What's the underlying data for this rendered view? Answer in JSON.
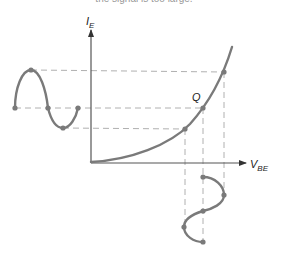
{
  "caption": "the signal is too large.",
  "axes": {
    "y_label": "I",
    "y_label_sub": "E",
    "x_label": "V",
    "x_label_sub": "BE"
  },
  "q_point_label": "Q",
  "colors": {
    "curve": "#7a7a7a",
    "dash": "#b0b0b0",
    "axis": "#555555",
    "text": "#222222"
  },
  "diagram": {
    "operating_points": [
      "lower",
      "Q",
      "upper"
    ]
  }
}
